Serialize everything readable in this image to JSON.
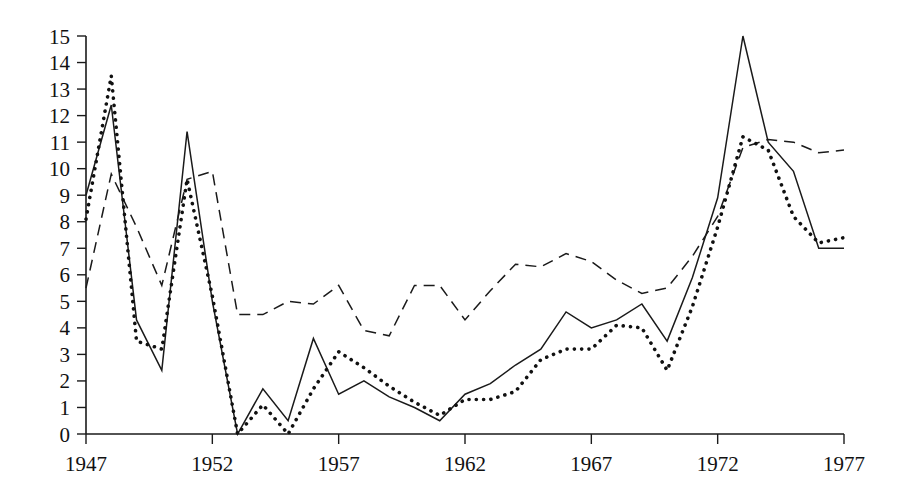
{
  "chart_data": {
    "type": "line",
    "title": "",
    "subtitle": "",
    "xlabel": "",
    "ylabel": "",
    "xlim": [
      1947,
      1977
    ],
    "ylim": [
      0,
      15
    ],
    "grid": false,
    "legend": "none",
    "x_ticks": [
      "1947",
      "1952",
      "1957",
      "1962",
      "1967",
      "1972",
      "1977"
    ],
    "x_tick_values": [
      1947,
      1952,
      1957,
      1962,
      1967,
      1972,
      1977
    ],
    "y_ticks": [
      "0",
      "1",
      "2",
      "3",
      "4",
      "5",
      "6",
      "7",
      "8",
      "9",
      "10",
      "11",
      "12",
      "13",
      "14",
      "15"
    ],
    "y_tick_values": [
      0,
      1,
      2,
      3,
      4,
      5,
      6,
      7,
      8,
      9,
      10,
      11,
      12,
      13,
      14,
      15
    ],
    "x": [
      1947,
      1948,
      1949,
      1950,
      1951,
      1952,
      1953,
      1954,
      1955,
      1956,
      1957,
      1958,
      1959,
      1960,
      1961,
      1962,
      1963,
      1964,
      1965,
      1966,
      1967,
      1968,
      1969,
      1970,
      1971,
      1972,
      1973,
      1974,
      1975,
      1976,
      1977
    ],
    "series": [
      {
        "name": "solid-series",
        "style": "solid",
        "color": "#1a1a1a",
        "values": [
          9.0,
          12.4,
          4.3,
          2.4,
          11.4,
          5.0,
          0.0,
          1.7,
          0.5,
          3.6,
          1.5,
          2.0,
          1.4,
          1.0,
          0.5,
          1.5,
          1.9,
          2.6,
          3.2,
          4.6,
          4.0,
          4.3,
          4.9,
          3.5,
          5.9,
          8.9,
          15.0,
          11.0,
          9.9,
          7.0,
          7.0
        ]
      },
      {
        "name": "dashed-series",
        "style": "dashed",
        "color": "#1a1a1a",
        "values": [
          5.5,
          9.8,
          7.8,
          5.6,
          9.6,
          9.9,
          4.5,
          4.5,
          5.0,
          4.9,
          5.6,
          3.9,
          3.7,
          5.6,
          5.6,
          4.3,
          5.4,
          6.4,
          6.3,
          6.8,
          6.5,
          5.8,
          5.3,
          5.5,
          6.7,
          8.2,
          10.8,
          11.1,
          11.0,
          10.6,
          10.7
        ]
      },
      {
        "name": "dotted-series",
        "style": "dotted",
        "color": "#111111",
        "values": [
          8.1,
          13.5,
          3.5,
          3.2,
          9.6,
          5.2,
          0.0,
          1.1,
          0.0,
          1.7,
          3.1,
          2.5,
          1.8,
          1.2,
          0.7,
          1.3,
          1.3,
          1.6,
          2.8,
          3.2,
          3.2,
          4.1,
          4.0,
          2.4,
          4.8,
          7.8,
          11.2,
          10.7,
          8.2,
          7.2,
          7.4
        ]
      }
    ]
  }
}
